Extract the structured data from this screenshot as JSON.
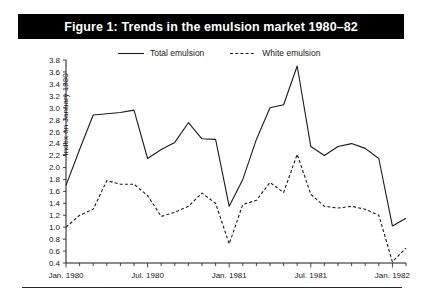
{
  "figure": {
    "title": "Figure 1: Trends in the emulsion market 1980–82",
    "banner_color": "#000000",
    "banner_text_color": "#ffffff"
  },
  "legend": {
    "position": "top-center",
    "items": [
      {
        "label": "Total emulsion",
        "style": "solid",
        "icon": "solid-line-swatch"
      },
      {
        "label": "White emulsion",
        "style": "dashed",
        "icon": "dashed-line-swatch"
      }
    ]
  },
  "axes": {
    "ylabel_line1": "Index on",
    "ylabel_line2": "January 1980",
    "ytick_labels": [
      "3.8",
      "3.6",
      "3.4",
      "3.2",
      "3.0",
      "2.8",
      "2.6",
      "2.4",
      "2.2",
      "2.0",
      "1.8",
      "1.6",
      "1.4",
      "1.2",
      "1.0",
      "0.8",
      "0.6",
      "0.4"
    ],
    "xtick_labels": [
      "Jan. 1980",
      "Jul. 1980",
      "Jan. 1981",
      "Jul. 1981",
      "Jan. 1982"
    ]
  },
  "chart_data": {
    "type": "line",
    "title": "Figure 1: Trends in the emulsion market 1980–82",
    "xlabel": "",
    "ylabel": "Index on January 1980",
    "ylim": [
      0.4,
      3.8
    ],
    "ytick_step": 0.2,
    "grid": false,
    "legend_position": "top-center",
    "x": [
      "Jan. 1980",
      "Feb. 1980",
      "Mar. 1980",
      "Apr. 1980",
      "May 1980",
      "Jun. 1980",
      "Jul. 1980",
      "Aug. 1980",
      "Sep. 1980",
      "Oct. 1980",
      "Nov. 1980",
      "Dec. 1980",
      "Jan. 1981",
      "Feb. 1981",
      "Mar. 1981",
      "Apr. 1981",
      "May 1981",
      "Jun. 1981",
      "Jul. 1981",
      "Aug. 1981",
      "Sep. 1981",
      "Oct. 1981",
      "Nov. 1981",
      "Dec. 1981",
      "Jan. 1982",
      "Feb. 1982"
    ],
    "x_major_labels": [
      "Jan. 1980",
      "Jul. 1980",
      "Jan. 1981",
      "Jul. 1981",
      "Jan. 1982"
    ],
    "x_major_indices": [
      0,
      6,
      12,
      18,
      24
    ],
    "series": [
      {
        "name": "Total emulsion",
        "style": "solid",
        "values": [
          1.7,
          2.3,
          2.88,
          2.9,
          2.92,
          2.96,
          2.15,
          2.3,
          2.42,
          2.75,
          2.48,
          2.47,
          1.35,
          1.8,
          2.47,
          3.0,
          3.05,
          3.7,
          2.35,
          2.2,
          2.35,
          2.4,
          2.32,
          2.15,
          1.02,
          1.15
        ]
      },
      {
        "name": "White emulsion",
        "style": "dashed",
        "values": [
          1.0,
          1.2,
          1.3,
          1.78,
          1.72,
          1.72,
          1.53,
          1.18,
          1.25,
          1.35,
          1.57,
          1.4,
          0.72,
          1.38,
          1.45,
          1.75,
          1.58,
          2.22,
          1.55,
          1.35,
          1.32,
          1.35,
          1.3,
          1.2,
          0.42,
          0.65
        ]
      }
    ]
  }
}
